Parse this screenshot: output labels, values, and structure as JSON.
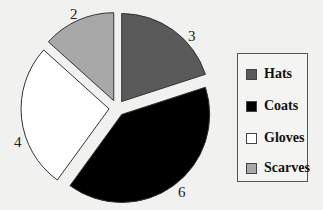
{
  "chart_data": {
    "type": "pie",
    "title": "",
    "categories": [
      "Hats",
      "Coats",
      "Gloves",
      "Scarves"
    ],
    "values": [
      3,
      6,
      4,
      2
    ],
    "colors": [
      "#5a5a5a",
      "#000000",
      "#ffffff",
      "#a8a8a8"
    ],
    "data_labels": [
      "3",
      "6",
      "4",
      "2"
    ],
    "exploded": true,
    "start_angle": "12 o'clock, clockwise",
    "legend_position": "right"
  },
  "legend": {
    "items": [
      {
        "label": "Hats",
        "color": "#5a5a5a"
      },
      {
        "label": "Coats",
        "color": "#000000"
      },
      {
        "label": "Gloves",
        "color": "#ffffff"
      },
      {
        "label": "Scarves",
        "color": "#a8a8a8"
      }
    ]
  }
}
